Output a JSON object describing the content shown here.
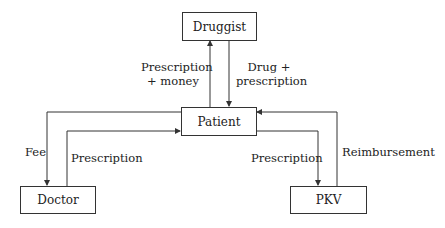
{
  "diagram": {
    "nodes": {
      "druggist": "Druggist",
      "patient": "Patient",
      "doctor": "Doctor",
      "pkv": "PKV"
    },
    "edges": {
      "patient_to_druggist": {
        "line1": "Prescription",
        "line2": "+ money"
      },
      "druggist_to_patient": {
        "line1": "Drug +",
        "line2": "prescription"
      },
      "patient_to_doctor": "Fee",
      "doctor_to_patient": "Prescription",
      "patient_to_pkv": "Prescription",
      "pkv_to_patient": "Reimbursement"
    },
    "colors": {
      "line": "#333333",
      "background": "#ffffff"
    }
  }
}
